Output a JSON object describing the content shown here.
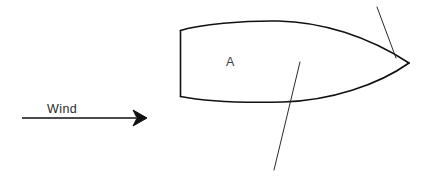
{
  "diagram": {
    "background_color": "#ffffff",
    "ink_color": "#111111",
    "labels": {
      "wind": "Wind",
      "hull_zone": "A"
    },
    "wind_arrow": {
      "name": "wind-direction-arrow",
      "label": "Wind",
      "direction": "left-to-right",
      "shaft_start": [
        22,
        118
      ],
      "shaft_end": [
        134,
        118
      ],
      "head_tip": [
        146,
        118
      ],
      "label_position": [
        47,
        113
      ],
      "color": "#111111"
    },
    "hull": {
      "name": "boat-hull-outline",
      "label": "A",
      "label_position": [
        226,
        66
      ],
      "stern_top": [
        180,
        30
      ],
      "stern_bottom": [
        180,
        96
      ],
      "bow_tip": [
        409,
        63
      ],
      "deck_peak": [
        276,
        21
      ],
      "keel_low": [
        282,
        102
      ],
      "stroke_width": 1.6,
      "color": "#111111"
    },
    "centerboard_line": {
      "name": "centerboard-line",
      "start": [
        300,
        62
      ],
      "end": [
        274,
        170
      ],
      "color": "#2a2a2a"
    },
    "forestay_line": {
      "name": "forestay-line",
      "start": [
        377,
        7
      ],
      "end": [
        396,
        58
      ],
      "color": "#2a2a2a"
    }
  }
}
